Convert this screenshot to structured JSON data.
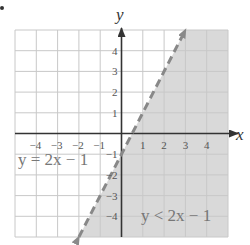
{
  "chart_data": {
    "type": "line",
    "title": "",
    "xlabel": "x",
    "ylabel": "y",
    "xlim": [
      -5,
      5
    ],
    "ylim": [
      -5,
      5
    ],
    "grid": true,
    "x_ticks": [
      -4,
      -3,
      -2,
      -1,
      1,
      2,
      3,
      4
    ],
    "y_ticks": [
      4,
      3,
      2,
      1,
      -1,
      -2,
      -3,
      -4
    ],
    "x_tick_labels": [
      "−4",
      "−3",
      "−2",
      "−1",
      "1",
      "2",
      "3",
      "4"
    ],
    "y_tick_labels": [
      "4",
      "3",
      "2",
      "1",
      "−1",
      "−2",
      "−3",
      "−4"
    ],
    "series": [
      {
        "name": "y = 2x − 1",
        "style": "dashed",
        "color": "#888888",
        "x": [
          -2,
          3
        ],
        "y": [
          -5,
          5
        ],
        "arrows": "both"
      }
    ],
    "shaded_region": {
      "inequality": "y < 2x − 1",
      "side": "below-right of line",
      "color": "#d9d9d9"
    },
    "annotations": [
      {
        "text": "y = 2x − 1",
        "x": -4.8,
        "y": -1.3
      },
      {
        "text": "y < 2x − 1",
        "x": 0.9,
        "y": -4.2
      }
    ]
  },
  "labels": {
    "x_axis": "x",
    "y_axis": "y",
    "line_equation": "y = 2x − 1",
    "inequality": "y < 2x − 1"
  },
  "colors": {
    "grid": "#c8c8c8",
    "axis": "#333333",
    "shade": "#d9d9d9",
    "line": "#8a8a8a"
  }
}
